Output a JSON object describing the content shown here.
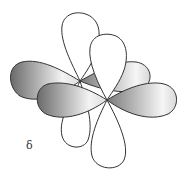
{
  "diagram": {
    "label": "δ",
    "colors": {
      "outline": "#333333",
      "white_lobe": "#ffffff",
      "shade_dark": "#6e6e6e",
      "shade_light": "#f2f2f2"
    },
    "orbitals": [
      {
        "name": "back-d-orbital",
        "center": [
          80,
          81
        ]
      },
      {
        "name": "front-d-orbital",
        "center": [
          107,
          100
        ]
      }
    ]
  }
}
